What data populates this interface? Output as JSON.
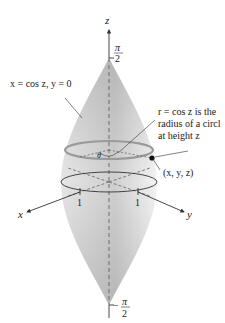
{
  "figure": {
    "axes": {
      "z_label": "z",
      "x_label": "x",
      "y_label": "y",
      "top_tick_num": "π",
      "top_tick_den": "2",
      "bottom_tick_num": "π",
      "bottom_tick_den": "2",
      "bottom_tick_sign": "−",
      "x_tick": "1",
      "y_tick": "1"
    },
    "annotations": {
      "curve_label": "x = cos z, y = 0",
      "radius_line1": "r = cos z is the",
      "radius_line2": "radius of a circl",
      "radius_line3": "at height z",
      "point_label": "(x, y, z)",
      "angle_label": "θ"
    },
    "colors": {
      "surface_light": "#f2f2f2",
      "surface_dark": "#bdbdbd",
      "circle": "#9a9a9a",
      "axis": "#333333",
      "point": "#111111"
    }
  }
}
